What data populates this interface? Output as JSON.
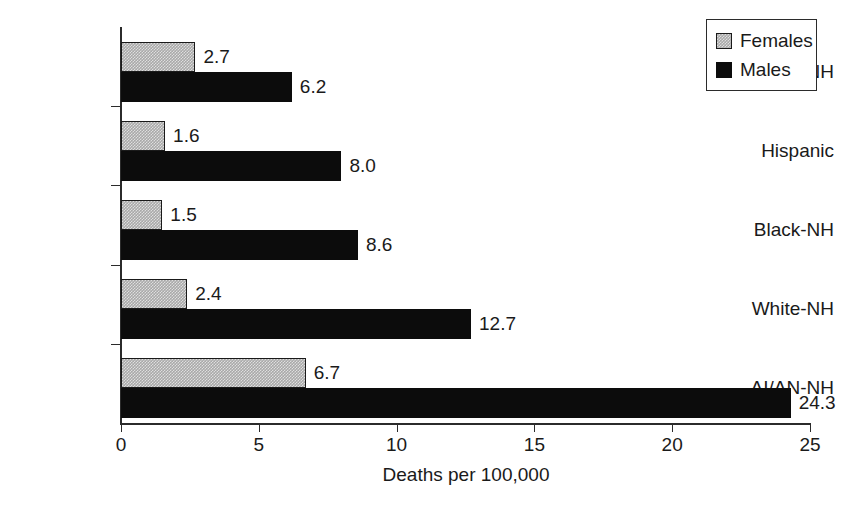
{
  "chart_data": {
    "type": "bar",
    "orientation": "horizontal",
    "title": "",
    "subtitle": "",
    "xlabel": "Deaths per 100,000",
    "ylabel": "",
    "categories": [
      "A/PI-NH",
      "Hispanic",
      "Black-NH",
      "White-NH",
      "AI/AN-NH"
    ],
    "series": [
      {
        "name": "Females",
        "color": "#a9a9a9",
        "values": [
          2.7,
          1.6,
          1.5,
          2.4,
          6.7
        ]
      },
      {
        "name": "Males",
        "color": "#0c0c0c",
        "values": [
          6.2,
          8.0,
          8.6,
          12.7,
          24.3
        ]
      }
    ],
    "value_labels": {
      "Females": [
        "2.7",
        "1.6",
        "1.5",
        "2.4",
        "6.7"
      ],
      "Males": [
        "6.2",
        "8.0",
        "8.6",
        "12.7",
        "24.3"
      ]
    },
    "xlim": [
      0,
      25
    ],
    "xticks": [
      0,
      5,
      10,
      15,
      20,
      25
    ],
    "xtick_labels": [
      "0",
      "5",
      "10",
      "15",
      "20",
      "25"
    ],
    "grid": false,
    "legend_position": "top-right",
    "legend_entries": [
      "Females",
      "Males"
    ]
  },
  "axis": {
    "x_title": "Deaths per 100,000",
    "tick_labels": [
      "0",
      "5",
      "10",
      "15",
      "20",
      "25"
    ]
  },
  "legend": {
    "items": [
      {
        "label": "Females",
        "swatch": "gray-swatch-icon"
      },
      {
        "label": "Males",
        "swatch": "black-swatch-icon"
      }
    ]
  },
  "categories": [
    "A/PI-NH",
    "Hispanic",
    "Black-NH",
    "White-NH",
    "AI/AN-NH"
  ]
}
